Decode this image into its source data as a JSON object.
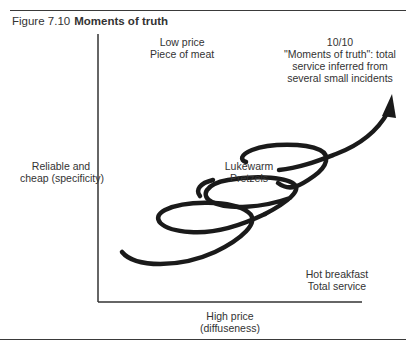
{
  "figure": {
    "number": "Figure 7.10",
    "title": "Moments of truth"
  },
  "labels": {
    "top_left": [
      "Low price",
      "Piece of meat"
    ],
    "top_right": [
      "10/10",
      "\"Moments of truth\": total",
      "service inferred from",
      "several small incidents"
    ],
    "y_axis": [
      "Reliable and",
      "cheap (specificity)"
    ],
    "center": [
      "Lukewarm",
      "Pretzels"
    ],
    "bottom_right": [
      "Hot breakfast",
      "Total service"
    ],
    "x_axis": [
      "High price",
      "(diffuseness)"
    ]
  },
  "diagram": {
    "type": "axes-with-spiral-arrow",
    "axis_color": "#333333",
    "curve_color": "#1a1a1a",
    "curve_description": "Upward spiral of three loops from lower-left rising to upper-right, ending in an arrowhead"
  }
}
